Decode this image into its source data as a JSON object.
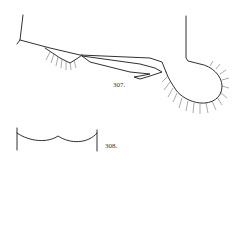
{
  "figures": [
    {
      "id": "307",
      "label": "307.",
      "description": "line drawing of appendage with setae"
    },
    {
      "id": "308",
      "label": "308.",
      "description": "outline of margin with two concave lobes"
    }
  ],
  "colors": {
    "ink": "#1a1a1a",
    "background": "#ffffff"
  }
}
